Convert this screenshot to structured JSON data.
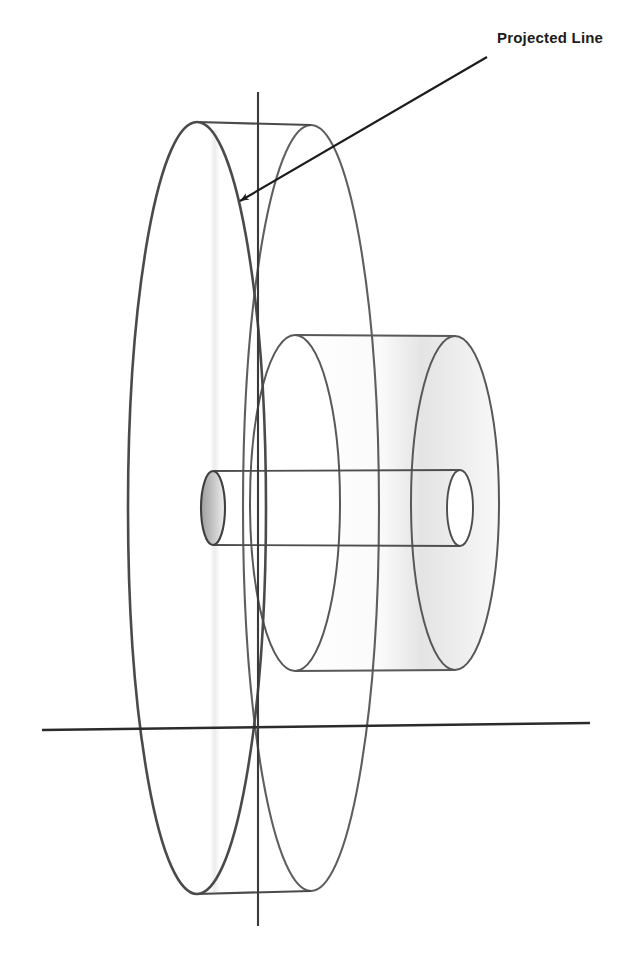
{
  "figure": {
    "title": "Projected Line",
    "background_color": "#ffffff",
    "annotations": [
      {
        "name": "projected-line-label",
        "text": "Projected Line",
        "x": 497,
        "y": 36,
        "leader": {
          "from_x": 487,
          "from_y": 57,
          "to_x": 234,
          "to_y": 205,
          "arrowhead": "filled-triangle"
        }
      }
    ],
    "colors": {
      "front_disc_stroke": "#4a4a4a",
      "back_disc_stroke": "#5e5e5e",
      "hub_stroke": "#585858",
      "shaft_stroke": "#4d4d4d",
      "axis_stroke": "#2b2b2b",
      "centerline_stroke": "#3a3a3a",
      "leader_stroke": "#1c1c1c",
      "label_text": "#1c1c1c",
      "hub_shading": "#e6e6e6",
      "shaft_end_shading": "#bdbdbd",
      "projection_band": "#ededed"
    },
    "geometry": {
      "disc_front_ellipse": {
        "cx": 197,
        "cy": 508,
        "rx": 69,
        "ry": 386
      },
      "disc_back_ellipse": {
        "cx": 311,
        "cy": 508,
        "rx": 68,
        "ry": 383
      },
      "disc_tangent_top": {
        "x1": 197,
        "y1": 122,
        "x2": 311,
        "y2": 125
      },
      "disc_tangent_bottom": {
        "x1": 197,
        "y1": 894,
        "x2": 311,
        "y2": 891
      },
      "hub_front_ellipse": {
        "cx": 295,
        "cy": 503,
        "rx": 45,
        "ry": 168
      },
      "hub_back_ellipse": {
        "cx": 455,
        "cy": 503,
        "rx": 44,
        "ry": 167
      },
      "hub_tangent_top": {
        "x1": 295,
        "y1": 335,
        "x2": 455,
        "y2": 336
      },
      "hub_tangent_bottom": {
        "x1": 295,
        "y1": 671,
        "x2": 455,
        "y2": 670
      },
      "shaft_front_ellipse": {
        "cx": 213,
        "cy": 508,
        "rx": 12,
        "ry": 37
      },
      "shaft_back_ellipse": {
        "cx": 460,
        "cy": 508,
        "rx": 13,
        "ry": 38
      },
      "shaft_tangent_top": {
        "x1": 213,
        "y1": 471,
        "x2": 460,
        "y2": 470
      },
      "shaft_tangent_bottom": {
        "x1": 213,
        "y1": 545,
        "x2": 460,
        "y2": 546
      },
      "horizontal_axis": {
        "x1": 42,
        "y1": 730,
        "x2": 590,
        "y2": 723
      },
      "vertical_centerline": {
        "x1": 258,
        "y1": 92,
        "x2": 258,
        "y2": 926
      },
      "projection_band": {
        "x": 210,
        "y": 130,
        "width": 9,
        "height": 760
      }
    },
    "element_names": {
      "front_disc": "flywheel-front-face-ellipse",
      "back_disc": "flywheel-back-face-ellipse",
      "hub_front": "hub-front-face-ellipse",
      "hub_back": "hub-back-face-ellipse",
      "shaft_front": "shaft-front-face-ellipse",
      "shaft_back": "shaft-back-face-ellipse",
      "axis": "horizontal-axis-line",
      "centerline": "vertical-center-line"
    }
  }
}
